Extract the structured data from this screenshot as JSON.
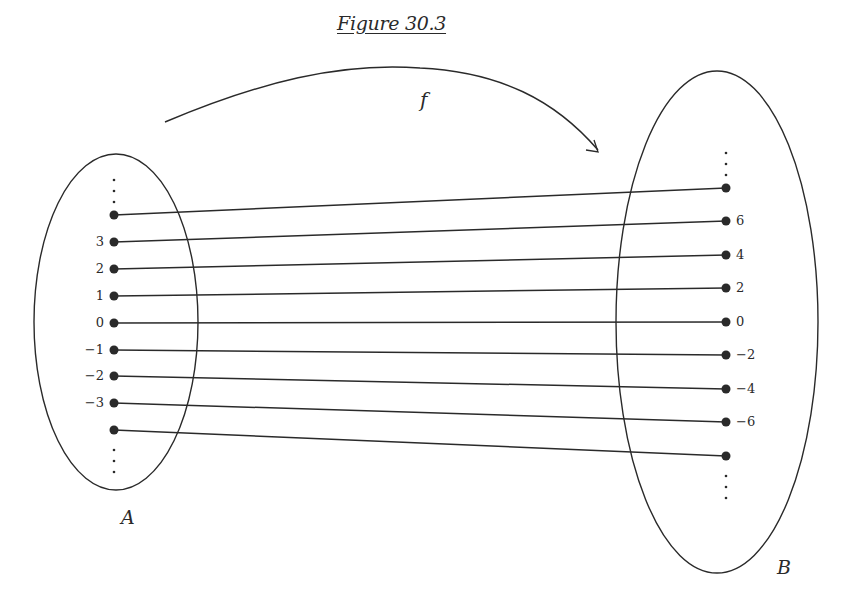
{
  "figure": {
    "title": "Figure 30.3",
    "function_label": "f",
    "domain_label": "A",
    "codomain_label": "B",
    "ink_color": "#2a2a2a",
    "background": "#ffffff"
  },
  "domain_set": {
    "name": "A",
    "ellipse": {
      "cx": 116,
      "cy": 322,
      "rx": 82,
      "ry": 168
    },
    "dot_x": 114,
    "top_ellipsis": true,
    "bottom_ellipsis": true,
    "elements": [
      {
        "label": "",
        "y": 215
      },
      {
        "label": "3",
        "y": 242
      },
      {
        "label": "2",
        "y": 269
      },
      {
        "label": "1",
        "y": 296
      },
      {
        "label": "0",
        "y": 323
      },
      {
        "label": "−1",
        "y": 350
      },
      {
        "label": "−2",
        "y": 376
      },
      {
        "label": "−3",
        "y": 403
      },
      {
        "label": "",
        "y": 430
      }
    ]
  },
  "codomain_set": {
    "name": "B",
    "ellipse": {
      "cx": 717,
      "cy": 322,
      "rx": 101,
      "ry": 251
    },
    "dot_x": 726,
    "top_ellipsis": true,
    "bottom_ellipsis": true,
    "elements": [
      {
        "label": "",
        "y": 188
      },
      {
        "label": "6",
        "y": 221
      },
      {
        "label": "4",
        "y": 255
      },
      {
        "label": "2",
        "y": 288
      },
      {
        "label": "0",
        "y": 322
      },
      {
        "label": "−2",
        "y": 355
      },
      {
        "label": "−4",
        "y": 389
      },
      {
        "label": "−6",
        "y": 422
      },
      {
        "label": "",
        "y": 456
      }
    ]
  },
  "mapping": {
    "rule": "f(n) = 2n",
    "pairs": [
      [
        "⋮",
        "⋮"
      ],
      [
        "3",
        "6"
      ],
      [
        "2",
        "4"
      ],
      [
        "1",
        "2"
      ],
      [
        "0",
        "0"
      ],
      [
        "−1",
        "−2"
      ],
      [
        "−2",
        "−4"
      ],
      [
        "−3",
        "−6"
      ],
      [
        "⋮",
        "⋮"
      ]
    ]
  }
}
